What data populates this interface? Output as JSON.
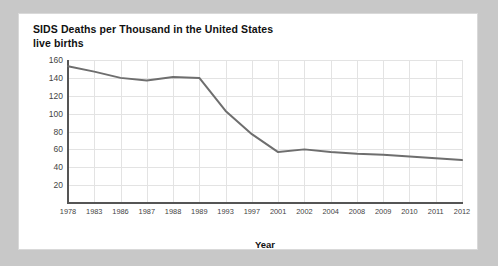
{
  "chart_data": {
    "type": "line",
    "title": "SIDS Deaths per Thousand in the United States live births",
    "title_line1": "SIDS Deaths per Thousand in the United States",
    "title_line2": "live births",
    "xlabel": "Year",
    "ylabel": "",
    "categories": [
      "1978",
      "1983",
      "1986",
      "1987",
      "1988",
      "1989",
      "1993",
      "1997",
      "2001",
      "2002",
      "2004",
      "2008",
      "2009",
      "2010",
      "2011",
      "2012"
    ],
    "values": [
      153,
      147,
      140,
      137,
      141,
      140,
      103,
      77,
      57,
      60,
      57,
      55,
      54,
      52,
      50,
      48
    ],
    "series": [
      {
        "name": "SIDS deaths per thousand live births",
        "values": [
          153,
          147,
          140,
          137,
          141,
          140,
          103,
          77,
          57,
          60,
          57,
          55,
          54,
          52,
          50,
          48
        ]
      }
    ],
    "yticks": [
      20,
      40,
      60,
      80,
      100,
      120,
      140,
      160
    ],
    "ylim": [
      0,
      160
    ],
    "grid": true,
    "legend": false,
    "line_color": "#6e6e6e",
    "grid_color": "#e3e3e3",
    "axis_color": "#555555",
    "panel_color": "#ffffff",
    "page_background": "#c8c8c8"
  }
}
